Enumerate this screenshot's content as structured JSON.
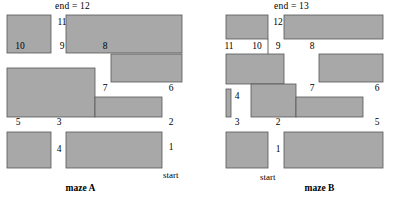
{
  "figure": {
    "background_color": "#ffffff",
    "wall_color": "#a8a8a8",
    "wall_outline_color": "#4a4a4a",
    "corridor_color": "#ffffff",
    "text_color": "#000000"
  },
  "mazes": [
    {
      "id": "maze-a",
      "caption": "maze A",
      "end_label": "end = 12",
      "start_label": "start",
      "path_length": 12,
      "steps": [
        {
          "n": "1",
          "x": 170,
          "y": 148
        },
        {
          "n": "2",
          "x": 170,
          "y": 123
        },
        {
          "n": "3",
          "x": 58,
          "y": 123
        },
        {
          "n": "4",
          "x": 58,
          "y": 150
        },
        {
          "n": "5",
          "x": 17,
          "y": 123
        },
        {
          "n": "6",
          "x": 170,
          "y": 89
        },
        {
          "n": "7",
          "x": 104,
          "y": 89
        },
        {
          "n": "8",
          "x": 104,
          "y": 47
        },
        {
          "n": "9",
          "x": 61,
          "y": 47
        },
        {
          "n": "10",
          "x": 19,
          "y": 47
        },
        {
          "n": "11",
          "x": 61,
          "y": 23
        }
      ]
    },
    {
      "id": "maze-b",
      "caption": "maze B",
      "end_label": "end = 13",
      "start_label": "start",
      "path_length": 13,
      "steps": [
        {
          "n": "1",
          "x": 277,
          "y": 150
        },
        {
          "n": "2",
          "x": 277,
          "y": 123
        },
        {
          "n": "3",
          "x": 236,
          "y": 123
        },
        {
          "n": "4",
          "x": 236,
          "y": 97
        },
        {
          "n": "5",
          "x": 376,
          "y": 123
        },
        {
          "n": "6",
          "x": 376,
          "y": 89
        },
        {
          "n": "7",
          "x": 311,
          "y": 89
        },
        {
          "n": "8",
          "x": 311,
          "y": 47
        },
        {
          "n": "9",
          "x": 277,
          "y": 47
        },
        {
          "n": "10",
          "x": 256,
          "y": 47
        },
        {
          "n": "11",
          "x": 228,
          "y": 47
        },
        {
          "n": "12",
          "x": 277,
          "y": 23
        }
      ]
    }
  ]
}
